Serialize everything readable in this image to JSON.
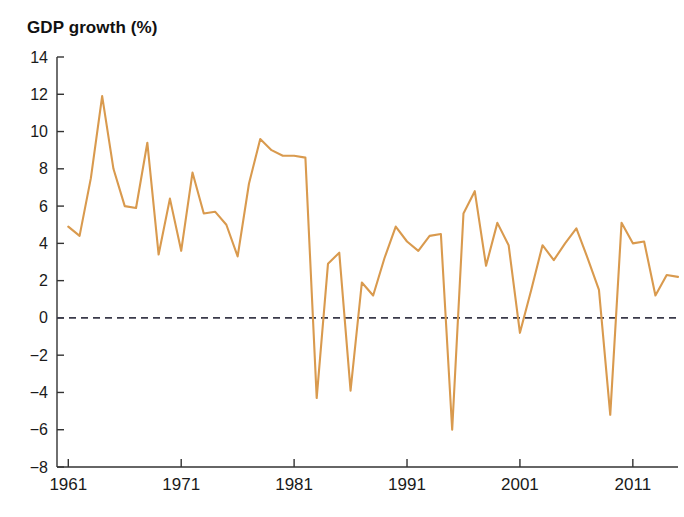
{
  "chart": {
    "title": "GDP growth (%)",
    "line_color": "#d99a4e",
    "axis_color": "#333333",
    "zero_line_color": "#3a3a4a",
    "background": "#ffffff"
  },
  "chart_data": {
    "type": "line",
    "title": "GDP growth (%)",
    "subtitle": "",
    "xlabel": "",
    "ylabel": "GDP growth (%)",
    "xlim": [
      1960,
      2015
    ],
    "ylim": [
      -8,
      14
    ],
    "ytick_labels": [
      "14",
      "12",
      "10",
      "8",
      "6",
      "4",
      "2",
      "0",
      "-2",
      "-4",
      "-6",
      "-8"
    ],
    "yticks": [
      14,
      12,
      10,
      8,
      6,
      4,
      2,
      0,
      -2,
      -4,
      -6,
      -8
    ],
    "xtick_labels": [
      "1961",
      "1971",
      "1981",
      "1991",
      "2001",
      "2011"
    ],
    "xticks": [
      1961,
      1971,
      1981,
      1991,
      2001,
      2011
    ],
    "grid": false,
    "legend": false,
    "zero_reference_line": 0,
    "zero_line_style": "dashed",
    "x": [
      1961,
      1962,
      1963,
      1964,
      1965,
      1966,
      1967,
      1968,
      1969,
      1970,
      1971,
      1972,
      1973,
      1974,
      1975,
      1976,
      1977,
      1978,
      1979,
      1980,
      1981,
      1982,
      1983,
      1984,
      1985,
      1986,
      1987,
      1988,
      1989,
      1990,
      1991,
      1992,
      1993,
      1994,
      1995,
      1996,
      1997,
      1998,
      1999,
      2000,
      2001,
      2002,
      2003,
      2004,
      2005,
      2006,
      2007,
      2008,
      2009,
      2010,
      2011,
      2012,
      2013,
      2014,
      2015
    ],
    "series": [
      {
        "name": "GDP growth",
        "color": "#d99a4e",
        "values": [
          4.9,
          4.4,
          7.5,
          11.9,
          8.0,
          6.0,
          5.9,
          9.4,
          3.4,
          6.4,
          3.6,
          7.8,
          5.6,
          5.7,
          5.0,
          3.3,
          7.2,
          9.6,
          9.0,
          8.7,
          8.7,
          8.6,
          -4.3,
          2.9,
          3.5,
          -3.9,
          1.9,
          1.2,
          3.2,
          4.9,
          4.1,
          3.6,
          4.4,
          4.5,
          -6.0,
          5.6,
          6.8,
          2.8,
          5.1,
          3.9,
          -0.8,
          1.5,
          3.9,
          3.1,
          4.0,
          4.8,
          3.2,
          1.5,
          -5.2,
          5.1,
          4.0,
          4.1,
          1.2,
          2.3,
          2.2
        ]
      }
    ]
  }
}
